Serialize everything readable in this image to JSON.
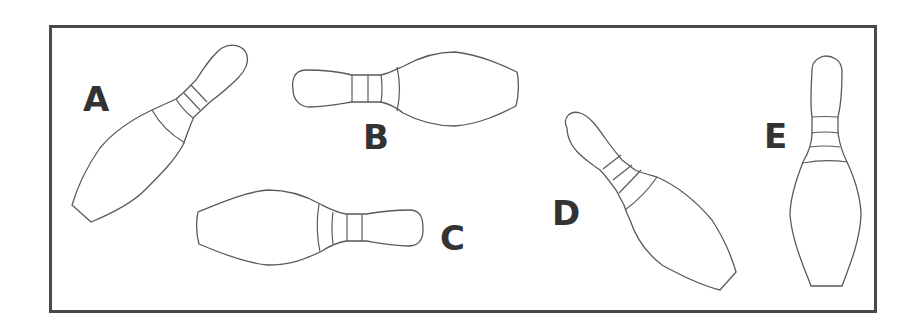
{
  "figure": {
    "border_color": "#4a4a4a",
    "stroke_color": "#5a5a5a",
    "label_color": "#333333",
    "pins": [
      {
        "label": "A",
        "orientation": "tilted, head up-right, base down-left"
      },
      {
        "label": "B",
        "orientation": "horizontal, head left"
      },
      {
        "label": "C",
        "orientation": "horizontal, head right"
      },
      {
        "label": "D",
        "orientation": "tilted, head up-left, base down-right"
      },
      {
        "label": "E",
        "orientation": "upright, head up"
      }
    ]
  }
}
